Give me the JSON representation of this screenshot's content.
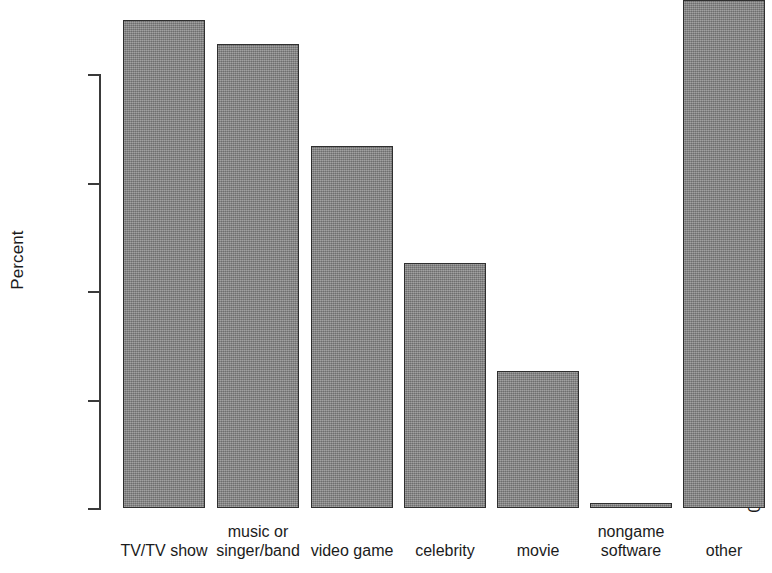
{
  "chart_data": {
    "type": "bar",
    "title": "",
    "xlabel": "",
    "ylabel": "Percent",
    "categories": [
      "TV/TV show",
      "music or singer/band",
      "video game",
      "celebrity",
      "movie",
      "nongame software",
      "other"
    ],
    "category_lines": [
      [
        "",
        "TV/TV show"
      ],
      [
        "music or",
        "singer/band"
      ],
      [
        "",
        "video game"
      ],
      [
        "",
        "celebrity"
      ],
      [
        "",
        "movie"
      ],
      [
        "nongame",
        "software"
      ],
      [
        "",
        "other"
      ]
    ],
    "values": [
      22.5,
      21.4,
      16.7,
      11.3,
      6.3,
      0.25,
      23.4
    ],
    "ylim": [
      0,
      20
    ],
    "ytick_labels": [
      "0",
      "5",
      "10",
      "15",
      "20"
    ],
    "ytick_values": [
      0,
      5,
      10,
      15,
      20
    ],
    "grid": false,
    "legend": false,
    "bar_fill_color": "#878787",
    "bar_edge_color": "#2f2f2f",
    "axis_color": "#3a3a3a",
    "background_color": "#ffffff",
    "note": "rightmost bar (other) extends above the top of the visible plot area"
  }
}
